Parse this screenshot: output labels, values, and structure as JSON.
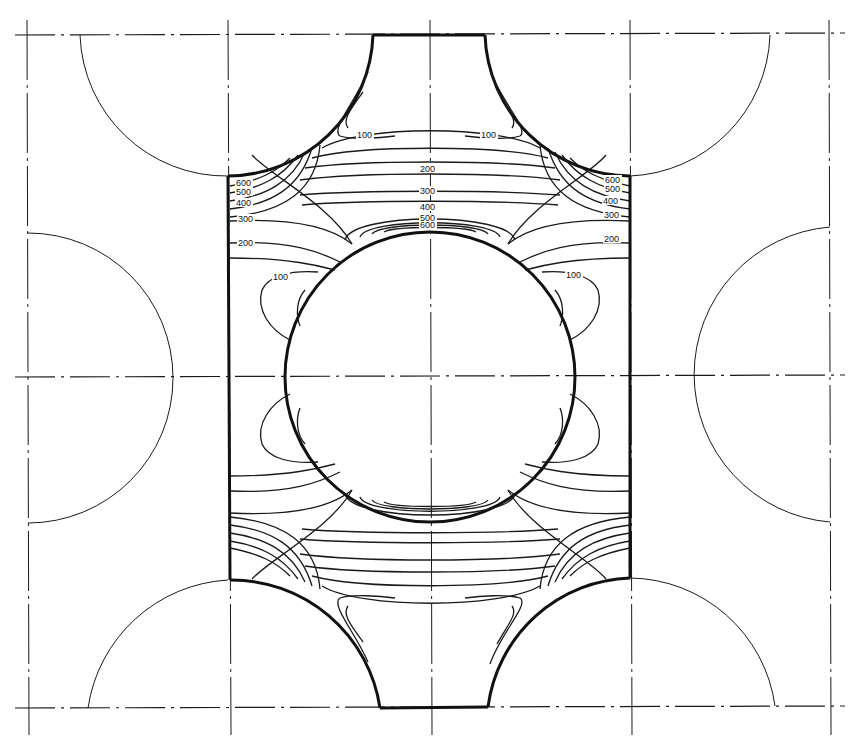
{
  "diagram": {
    "type": "stress contour plot",
    "contour_levels": [
      "100",
      "200",
      "300",
      "400",
      "500",
      "600"
    ],
    "labels": {
      "left_edge": [
        "600",
        "500",
        "400",
        "300",
        "200"
      ],
      "right_edge": [
        "600",
        "500",
        "400",
        "300",
        "200"
      ],
      "center_top": [
        "200",
        "300",
        "400",
        "500",
        "600"
      ],
      "top_left_100": "100",
      "top_right_100": "100",
      "mid_left_100": "100",
      "mid_right_100": "100"
    },
    "colors": {
      "line": "#1a1a1a",
      "background": "#ffffff"
    }
  }
}
